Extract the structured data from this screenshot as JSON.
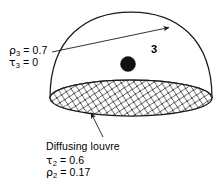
{
  "figure": {
    "type": "optical-cavity-diagram"
  },
  "labels": {
    "rho3": {
      "symbol": "ρ",
      "subscript": "3",
      "equals": "=",
      "value": "0.7"
    },
    "tau3": {
      "symbol": "τ",
      "subscript": "3",
      "equals": "=",
      "value": "0"
    },
    "louvre_name": "Diffusing louvre",
    "tau2": {
      "symbol": "τ",
      "subscript": "2",
      "equals": "=",
      "value": "0.6"
    },
    "rho2": {
      "symbol": "ρ",
      "subscript": "2",
      "equals": "=",
      "value": "0.17"
    },
    "zone3": "3"
  },
  "geometry": {
    "dome": {
      "cx": 131,
      "apex_y": 12,
      "left_x": 58,
      "right_x": 210,
      "base_y": 98
    },
    "base_ellipse": {
      "cx": 131,
      "cy": 98,
      "rx": 81,
      "ry": 18
    },
    "lamp": {
      "cx": 128,
      "cy": 64,
      "r": 7.5
    },
    "arrow_radius": {
      "from_x": 52,
      "from_y": 52,
      "to_x": 171,
      "to_y": 27
    },
    "leader_louvre": {
      "from_x": 102,
      "from_y": 138,
      "to_x": 90,
      "to_y": 112
    }
  },
  "colors": {
    "stroke": "#1a1a1a",
    "lamp_fill": "#111111",
    "hatch": "#3a3a3a",
    "background": "#ffffff",
    "text": "#000000"
  },
  "icons": {
    "arrow": "arrow-head-icon",
    "hatch": "cross-hatch-pattern-icon"
  }
}
